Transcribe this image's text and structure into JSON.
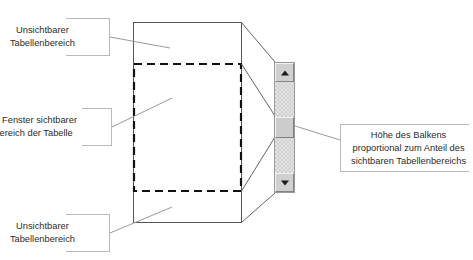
{
  "diagram": {
    "colors": {
      "table_border": "#555555",
      "visible_area_dash": "#111111",
      "callout_border": "#b9b9b9",
      "leader_line": "#9a9a9a",
      "projection_line": "#666666",
      "scrollbar_track": "#e4e4e4",
      "scrollbar_button": "#d0d0d0",
      "scrollbar_thumb": "#cccccc",
      "text": "#2b2b2b"
    },
    "callouts": [
      {
        "id": "top-hidden-area",
        "lines": [
          "Unsichtbarer",
          "Tabellenbereich"
        ]
      },
      {
        "id": "visible-area",
        "lines": [
          "Im Fenster sichtbarer",
          "Bereich der Tabelle"
        ]
      },
      {
        "id": "bottom-hidden-area",
        "lines": [
          "Unsichtbarer",
          "Tabellenbereich"
        ]
      },
      {
        "id": "thumb-height",
        "lines": [
          "Höhe des Balkens",
          "proportional zum Anteil des",
          "sichtbaren Tabellenbereichs"
        ]
      }
    ],
    "scrollbar": {
      "up_arrow_icon": "triangle-up-icon",
      "down_arrow_icon": "triangle-down-icon",
      "thumb_label": "scrollbar-thumb"
    }
  }
}
